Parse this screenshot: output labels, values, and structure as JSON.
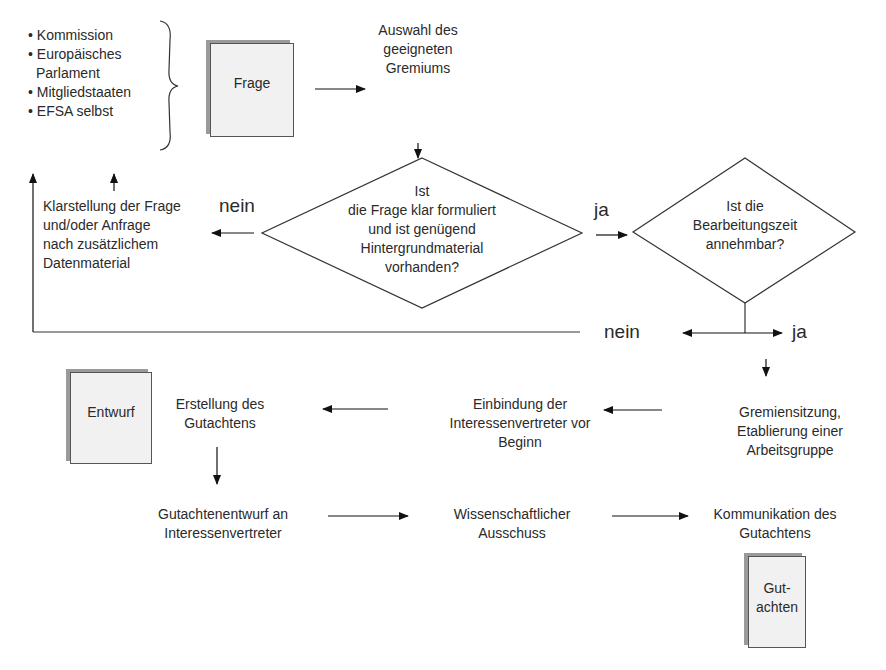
{
  "sources": {
    "items": [
      "• Kommission",
      "• Europäisches",
      "Parlament",
      "• Mitgliedstaaten",
      "• EFSA selbst"
    ]
  },
  "docs": {
    "frage": "Frage",
    "entwurf": "Entwurf",
    "gutachten_l1": "Gut-",
    "gutachten_l2": "achten"
  },
  "steps": {
    "auswahl": [
      "Auswahl des",
      "geeigneten",
      "Gremiums"
    ],
    "klarstellung": [
      "Klarstellung der Frage",
      "und/oder Anfrage",
      "nach zusätzlichem",
      "Datenmaterial"
    ],
    "gremiensitzung": [
      "Gremiensitzung,",
      "Etablierung einer",
      "Arbeitsgruppe"
    ],
    "einbindung": [
      "Einbindung der",
      "Interessenvertreter vor",
      "Beginn"
    ],
    "erstellung": [
      "Erstellung des",
      "Gutachtens"
    ],
    "entwurf_an": [
      "Gutachtenentwurf an",
      "Interessenvertreter"
    ],
    "ausschuss": [
      "Wissenschaftlicher",
      "Ausschuss"
    ],
    "kommunikation": [
      "Kommunikation des",
      "Gutachtens"
    ]
  },
  "decisions": {
    "d1": [
      "Ist",
      "die Frage klar formuliert",
      "und ist genügend",
      "Hintergrundmaterial",
      "vorhanden?"
    ],
    "d2": [
      "Ist die",
      "Bearbeitungszeit",
      "annehmbar?"
    ]
  },
  "labels": {
    "nein1": "nein",
    "ja1": "ja",
    "nein2": "nein",
    "ja2": "ja"
  }
}
